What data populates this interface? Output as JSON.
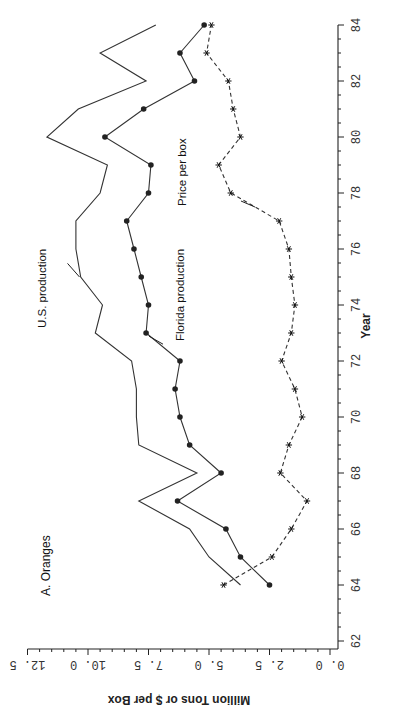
{
  "chart_data": {
    "type": "line",
    "title": "A. Oranges",
    "xlabel": "Year",
    "ylabel": "Million Tons or $ per Box",
    "orientation": "rotated -90deg (year axis vertical on right, value axis horizontal at bottom)",
    "xlim": [
      62,
      84
    ],
    "ylim": [
      0.0,
      12.5
    ],
    "x_ticks": [
      "62",
      "64",
      "66",
      "68",
      "70",
      "72",
      "74",
      "76",
      "78",
      "80",
      "82",
      "84"
    ],
    "y_ticks": [
      "0.0",
      "2.5",
      "5.0",
      "7.5",
      "10.0",
      "12.5"
    ],
    "grid": false,
    "legend": "inline annotations",
    "x": [
      64,
      65,
      66,
      67,
      68,
      69,
      70,
      71,
      72,
      73,
      74,
      75,
      76,
      77,
      78,
      79,
      80,
      81,
      82,
      83,
      84
    ],
    "series": [
      {
        "name": "U.S. production",
        "marker": "none",
        "line": "solid",
        "values": [
          3.7,
          5.0,
          5.8,
          7.9,
          5.5,
          7.9,
          8.0,
          8.0,
          8.2,
          9.7,
          9.4,
          10.3,
          10.5,
          10.5,
          9.5,
          9.2,
          11.7,
          10.4,
          7.6,
          9.5,
          7.2
        ]
      },
      {
        "name": "Florida production",
        "marker": "circle",
        "line": "solid",
        "values": [
          2.5,
          3.7,
          4.3,
          6.3,
          4.5,
          5.8,
          6.2,
          6.4,
          6.2,
          7.6,
          7.5,
          7.8,
          8.1,
          8.4,
          7.5,
          7.4,
          9.3,
          7.7,
          5.6,
          6.2,
          5.2
        ]
      },
      {
        "name": "Price per box",
        "marker": "asterisk",
        "line": "dashed",
        "values": [
          4.4,
          2.4,
          1.6,
          0.95,
          2.05,
          1.7,
          1.15,
          1.45,
          2.0,
          1.6,
          1.45,
          1.6,
          1.7,
          2.1,
          4.1,
          4.6,
          3.7,
          4.0,
          4.2,
          5.1,
          4.9
        ]
      }
    ],
    "annotations": [
      "U.S. production",
      "Florida production",
      "Price per box"
    ]
  },
  "labels": {
    "title": "A. Oranges",
    "xlabel": "Year",
    "ylabel": "Million Tons or $ per Box",
    "us": "U.S. production",
    "fl": "Florida production",
    "pr": "Price per box"
  }
}
